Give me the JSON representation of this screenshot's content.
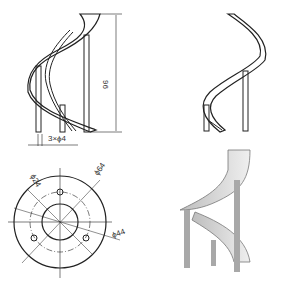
{
  "views": {
    "front": {
      "height_dim": "96",
      "hole_note": "3×ϕ4"
    },
    "top": {
      "dims": [
        "ϕ24",
        "ϕ64",
        "ϕ44"
      ]
    },
    "iso_wire": {},
    "iso_shaded": {}
  },
  "colors": {
    "line": "#222222",
    "shade_light": "#e6e6e6",
    "shade_dark": "#9a9a9a"
  }
}
